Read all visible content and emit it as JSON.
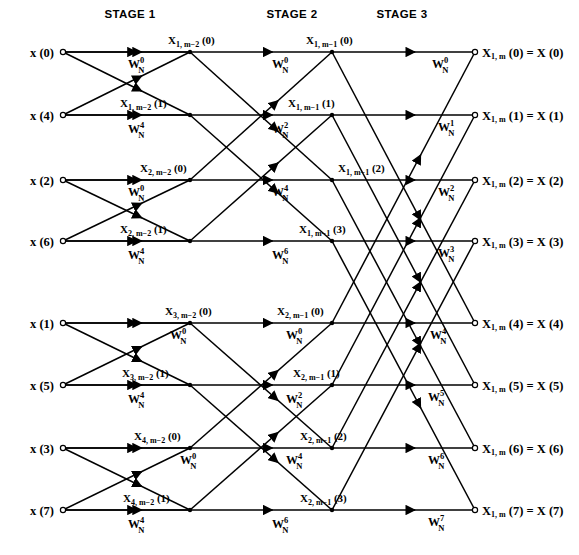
{
  "stages": [
    {
      "id": "stage-1",
      "label": "STAGE 1",
      "x": 130
    },
    {
      "id": "stage-2",
      "label": "STAGE 2",
      "x": 292
    },
    {
      "id": "stage-3",
      "label": "STAGE 3",
      "x": 402
    }
  ],
  "geometry": {
    "input_x": 63,
    "stage1_x": 190,
    "stage2_x": 332,
    "output_x": 475,
    "row_y": [
      52,
      115,
      180,
      241,
      323,
      385,
      448,
      510
    ]
  },
  "inputs": [
    {
      "label": "x (0)",
      "row": 0
    },
    {
      "label": "x (4)",
      "row": 1
    },
    {
      "label": "x (2)",
      "row": 2
    },
    {
      "label": "x (6)",
      "row": 3
    },
    {
      "label": "x (1)",
      "row": 4
    },
    {
      "label": "x (5)",
      "row": 5
    },
    {
      "label": "x (3)",
      "row": 6
    },
    {
      "label": "x (7)",
      "row": 7
    }
  ],
  "outputs": [
    {
      "base": "X",
      "sub": "1, m",
      "arg": "(0)",
      "equals": "= X (0)",
      "row": 0
    },
    {
      "base": "X",
      "sub": "1, m",
      "arg": "(1)",
      "equals": "= X (1)",
      "row": 1
    },
    {
      "base": "X",
      "sub": "1, m",
      "arg": "(2)",
      "equals": "= X (2)",
      "row": 2
    },
    {
      "base": "X",
      "sub": "1, m",
      "arg": "(3)",
      "equals": "= X (3)",
      "row": 3
    },
    {
      "base": "X",
      "sub": "1, m",
      "arg": "(4)",
      "equals": "= X (4)",
      "row": 4
    },
    {
      "base": "X",
      "sub": "1, m",
      "arg": "(5)",
      "equals": "= X (5)",
      "row": 5
    },
    {
      "base": "X",
      "sub": "1, m",
      "arg": "(6)",
      "equals": "= X (6)",
      "row": 6
    },
    {
      "base": "X",
      "sub": "1, m",
      "arg": "(7)",
      "equals": "= X (7)",
      "row": 7
    }
  ],
  "stage1_node_labels": [
    {
      "base": "X",
      "sub": "1, m−2",
      "arg": "(0)",
      "row": 0,
      "x": 168,
      "dy": -8,
      "anchor": "start"
    },
    {
      "base": "X",
      "sub": "1, m−2",
      "arg": "(1)",
      "row": 1,
      "x": 120,
      "dy": -8,
      "anchor": "start"
    },
    {
      "base": "X",
      "sub": "2, m−2",
      "arg": "(0)",
      "row": 2,
      "x": 140,
      "dy": -8,
      "anchor": "start"
    },
    {
      "base": "X",
      "sub": "2, m−2",
      "arg": "(1)",
      "row": 3,
      "x": 120,
      "dy": -8,
      "anchor": "start"
    },
    {
      "base": "X",
      "sub": "3, m−2",
      "arg": "(0)",
      "row": 4,
      "x": 165,
      "dy": -8,
      "anchor": "start"
    },
    {
      "base": "X",
      "sub": "3, m−2",
      "arg": "(1)",
      "row": 5,
      "x": 122,
      "dy": -8,
      "anchor": "start"
    },
    {
      "base": "X",
      "sub": "4, m−2",
      "arg": "(0)",
      "row": 6,
      "x": 134,
      "dy": -8,
      "anchor": "start"
    },
    {
      "base": "X",
      "sub": "4, m−2",
      "arg": "(1)",
      "row": 7,
      "x": 123,
      "dy": -8,
      "anchor": "start"
    }
  ],
  "stage2_node_labels": [
    {
      "base": "X",
      "sub": "1, m−1",
      "arg": "(0)",
      "row": 0,
      "x": 306,
      "dy": -8,
      "anchor": "start"
    },
    {
      "base": "X",
      "sub": "1, m−1",
      "arg": "(1)",
      "row": 1,
      "x": 288,
      "dy": -8,
      "anchor": "start"
    },
    {
      "base": "X",
      "sub": "1, m−1",
      "arg": "(2)",
      "row": 2,
      "x": 338,
      "dy": -8,
      "anchor": "start"
    },
    {
      "base": "X",
      "sub": "1, m−1",
      "arg": "(3)",
      "row": 3,
      "x": 299,
      "dy": -8,
      "anchor": "start"
    },
    {
      "base": "X",
      "sub": "2, m−1",
      "arg": "(0)",
      "row": 4,
      "x": 277,
      "dy": -8,
      "anchor": "start"
    },
    {
      "base": "X",
      "sub": "2, m−1",
      "arg": "(1)",
      "row": 5,
      "x": 293,
      "dy": -8,
      "anchor": "start"
    },
    {
      "base": "X",
      "sub": "2, m−1",
      "arg": "(2)",
      "row": 6,
      "x": 300,
      "dy": -8,
      "anchor": "start"
    },
    {
      "base": "X",
      "sub": "2, m−1",
      "arg": "(3)",
      "row": 7,
      "x": 300,
      "dy": -8,
      "anchor": "start"
    }
  ],
  "twiddles_stage1": [
    {
      "base": "W",
      "sub": "N",
      "sup": "0",
      "row": 0,
      "x": 128,
      "dy": 16
    },
    {
      "base": "W",
      "sub": "N",
      "sup": "4",
      "row": 1,
      "x": 128,
      "dy": 18
    },
    {
      "base": "W",
      "sub": "N",
      "sup": "0",
      "row": 2,
      "x": 128,
      "dy": 16
    },
    {
      "base": "W",
      "sub": "N",
      "sup": "4",
      "row": 3,
      "x": 128,
      "dy": 18
    },
    {
      "base": "W",
      "sub": "N",
      "sup": "0",
      "row": 4,
      "x": 170,
      "dy": 16
    },
    {
      "base": "W",
      "sub": "N",
      "sup": "4",
      "row": 5,
      "x": 128,
      "dy": 18
    },
    {
      "base": "W",
      "sub": "N",
      "sup": "0",
      "row": 6,
      "x": 180,
      "dy": 16
    },
    {
      "base": "W",
      "sub": "N",
      "sup": "4",
      "row": 7,
      "x": 128,
      "dy": 18
    }
  ],
  "twiddles_stage2": [
    {
      "base": "W",
      "sub": "N",
      "sup": "0",
      "row": 0,
      "x": 272,
      "dy": 16
    },
    {
      "base": "W",
      "sub": "N",
      "sup": "2",
      "row": 1,
      "x": 272,
      "dy": 18
    },
    {
      "base": "W",
      "sub": "N",
      "sup": "4",
      "row": 2,
      "x": 272,
      "dy": 16
    },
    {
      "base": "W",
      "sub": "N",
      "sup": "6",
      "row": 3,
      "x": 272,
      "dy": 18
    },
    {
      "base": "W",
      "sub": "N",
      "sup": "0",
      "row": 4,
      "x": 286,
      "dy": 16
    },
    {
      "base": "W",
      "sub": "N",
      "sup": "2",
      "row": 5,
      "x": 286,
      "dy": 18
    },
    {
      "base": "W",
      "sub": "N",
      "sup": "4",
      "row": 6,
      "x": 286,
      "dy": 16
    },
    {
      "base": "W",
      "sub": "N",
      "sup": "6",
      "row": 7,
      "x": 272,
      "dy": 18
    }
  ],
  "twiddles_stage3": [
    {
      "base": "W",
      "sub": "N",
      "sup": "0",
      "row": 0,
      "x": 432,
      "dy": 16
    },
    {
      "base": "W",
      "sub": "N",
      "sup": "1",
      "row": 1,
      "x": 438,
      "dy": 16
    },
    {
      "base": "W",
      "sub": "N",
      "sup": "2",
      "row": 2,
      "x": 438,
      "dy": 16
    },
    {
      "base": "W",
      "sub": "N",
      "sup": "3",
      "row": 3,
      "x": 438,
      "dy": 16
    },
    {
      "base": "W",
      "sub": "N",
      "sup": "4",
      "row": 4,
      "x": 430,
      "dy": 16
    },
    {
      "base": "W",
      "sub": "N",
      "sup": "5",
      "row": 5,
      "x": 428,
      "dy": 16
    },
    {
      "base": "W",
      "sub": "N",
      "sup": "6",
      "row": 6,
      "x": 428,
      "dy": 16
    },
    {
      "base": "W",
      "sub": "N",
      "sup": "7",
      "row": 7,
      "x": 428,
      "dy": 16
    }
  ],
  "graph": {
    "stage1_pairs": [
      [
        0,
        1
      ],
      [
        2,
        3
      ],
      [
        4,
        5
      ],
      [
        6,
        7
      ]
    ],
    "stage2_pairs": [
      [
        0,
        2
      ],
      [
        1,
        3
      ],
      [
        4,
        6
      ],
      [
        5,
        7
      ]
    ],
    "stage3_pairs": [
      [
        0,
        4
      ],
      [
        1,
        5
      ],
      [
        2,
        6
      ],
      [
        3,
        7
      ]
    ],
    "line_color": "#000000",
    "background": "#ffffff"
  }
}
